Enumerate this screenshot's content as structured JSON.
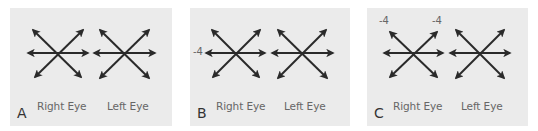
{
  "colors": {
    "panel_bg": "#ebebeb",
    "arrow": "#2a2a2a",
    "label": "#666666"
  },
  "panels": [
    {
      "letter": "A",
      "right_eye_label": "Right Eye",
      "left_eye_label": "Left Eye",
      "annotations": []
    },
    {
      "letter": "B",
      "right_eye_label": "Right Eye",
      "left_eye_label": "Left Eye",
      "annotations": [
        {
          "text": "-4",
          "position": "right-eye-left-horizontal"
        }
      ]
    },
    {
      "letter": "C",
      "right_eye_label": "Right Eye",
      "left_eye_label": "Left Eye",
      "annotations": [
        {
          "text": "-4",
          "position": "right-eye-upper-left"
        },
        {
          "text": "-4",
          "position": "right-eye-upper-right"
        }
      ]
    }
  ]
}
